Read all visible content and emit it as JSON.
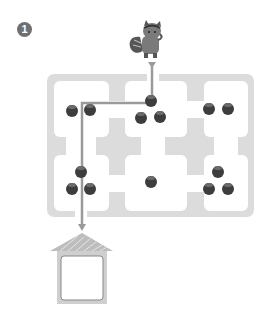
{
  "puzzle": {
    "number_label": "1",
    "type": "maze",
    "start_character": "squirrel-icon",
    "goal": "house-icon",
    "colors": {
      "maze_wall": "#dcdcdc",
      "maze_room": "#ffffff",
      "path_line": "#9a9a9a",
      "acorn": "#3d3d3d",
      "squirrel": "#7a7a7a",
      "house_roof": "#bdbdbd",
      "house_wall": "#cfcfcf",
      "number_badge": "#6f6f6f"
    },
    "rooms": [
      {
        "row": 1,
        "col": 1,
        "acorns": 2,
        "on_path": true
      },
      {
        "row": 1,
        "col": 2,
        "acorns": 3,
        "on_path": true
      },
      {
        "row": 1,
        "col": 3,
        "acorns": 2,
        "on_path": false
      },
      {
        "row": 2,
        "col": 1,
        "acorns": 3,
        "on_path": true
      },
      {
        "row": 2,
        "col": 2,
        "acorns": 1,
        "on_path": false
      },
      {
        "row": 2,
        "col": 3,
        "acorns": 3,
        "on_path": false
      }
    ]
  }
}
